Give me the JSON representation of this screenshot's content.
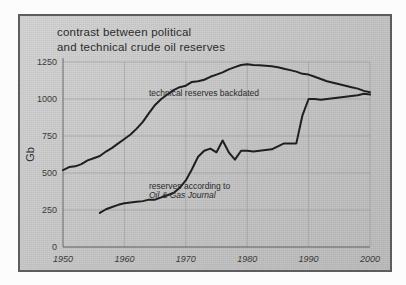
{
  "figure": {
    "title_line1": "contrast between political",
    "title_line2": "and technical crude oil reserves",
    "title_full": "contrast between political\nand technical crude oil reserves",
    "frame_color": "#5d5d5d",
    "background_color": "#c6c6c6",
    "line_color": "#1f1f1f"
  },
  "chart_data": {
    "type": "line",
    "title": "contrast between political and technical crude oil reserves",
    "xlabel": "",
    "ylabel": "Gb",
    "xlim": [
      1950,
      2000
    ],
    "ylim": [
      0,
      1250
    ],
    "xticks": [
      1950,
      1960,
      1970,
      1980,
      1990,
      2000
    ],
    "xticklabels": [
      "1950",
      "1960",
      "1970",
      "1980",
      "1990",
      "2000"
    ],
    "yticks": [
      0,
      250,
      500,
      750,
      1000,
      1250
    ],
    "yticklabels": [
      "0",
      "250",
      "500",
      "750",
      "1000",
      "1250"
    ],
    "grid": true,
    "legend": "none",
    "annotations": [
      {
        "name": "technical-reserves-label",
        "text": "technical reserves backdated",
        "x": 1964,
        "y": 1020
      },
      {
        "name": "ogj-reserves-label-line1",
        "text": "reserves according to",
        "x": 1964,
        "y": 390
      },
      {
        "name": "ogj-reserves-label-line2",
        "text": "Oil & Gas Journal",
        "x": 1964,
        "y": 330,
        "style": "italic"
      }
    ],
    "series": [
      {
        "name": "technical reserves backdated",
        "x": [
          1950,
          1951,
          1952,
          1953,
          1954,
          1955,
          1956,
          1957,
          1958,
          1959,
          1960,
          1961,
          1962,
          1963,
          1964,
          1965,
          1966,
          1967,
          1968,
          1969,
          1970,
          1971,
          1972,
          1973,
          1974,
          1975,
          1976,
          1977,
          1978,
          1979,
          1980,
          1981,
          1982,
          1983,
          1984,
          1985,
          1986,
          1987,
          1988,
          1989,
          1990,
          1991,
          1992,
          1993,
          1994,
          1995,
          1996,
          1997,
          1998,
          1999,
          2000
        ],
        "values": [
          520,
          540,
          545,
          560,
          585,
          600,
          615,
          645,
          670,
          700,
          730,
          760,
          800,
          845,
          905,
          960,
          1000,
          1030,
          1060,
          1080,
          1090,
          1115,
          1120,
          1130,
          1150,
          1165,
          1180,
          1200,
          1215,
          1230,
          1235,
          1230,
          1228,
          1225,
          1222,
          1215,
          1205,
          1195,
          1185,
          1170,
          1165,
          1150,
          1135,
          1120,
          1110,
          1100,
          1090,
          1080,
          1070,
          1055,
          1045
        ]
      },
      {
        "name": "reserves according to Oil & Gas Journal",
        "x": [
          1956,
          1957,
          1958,
          1959,
          1960,
          1961,
          1962,
          1963,
          1964,
          1965,
          1966,
          1967,
          1968,
          1969,
          1970,
          1971,
          1972,
          1973,
          1974,
          1975,
          1976,
          1977,
          1978,
          1979,
          1980,
          1981,
          1982,
          1983,
          1984,
          1985,
          1986,
          1987,
          1988,
          1989,
          1990,
          1991,
          1992,
          1993,
          1994,
          1995,
          1996,
          1997,
          1998,
          1999,
          2000
        ],
        "values": [
          230,
          255,
          270,
          285,
          295,
          300,
          305,
          310,
          320,
          320,
          335,
          350,
          365,
          400,
          450,
          525,
          610,
          650,
          665,
          640,
          720,
          640,
          590,
          650,
          650,
          645,
          650,
          655,
          660,
          680,
          700,
          700,
          700,
          890,
          1000,
          1000,
          995,
          1000,
          1005,
          1010,
          1015,
          1020,
          1025,
          1035,
          1030
        ]
      }
    ]
  }
}
